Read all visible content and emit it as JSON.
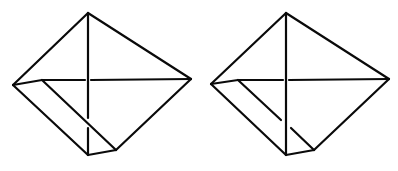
{
  "diagram": {
    "stroke_color": "#0a0a0a",
    "background": "#ffffff",
    "figures": [
      {
        "id": "figure-left",
        "vertices": {
          "top": [
            88,
            13
          ],
          "left": [
            13,
            85
          ],
          "right": [
            191,
            79
          ],
          "inner_left": [
            42,
            80
          ],
          "bottom": [
            88,
            155
          ],
          "bottom_right": [
            116,
            150
          ]
        },
        "occlusion": "diagonal in front of vertical line"
      },
      {
        "id": "figure-right",
        "vertices": {
          "top": [
            286,
            13
          ],
          "left": [
            211,
            84
          ],
          "right": [
            389,
            79
          ],
          "inner_left": [
            238,
            80
          ],
          "bottom": [
            286,
            155
          ],
          "bottom_right": [
            314,
            150
          ]
        },
        "occlusion": "vertical line in front of diagonal"
      }
    ]
  }
}
